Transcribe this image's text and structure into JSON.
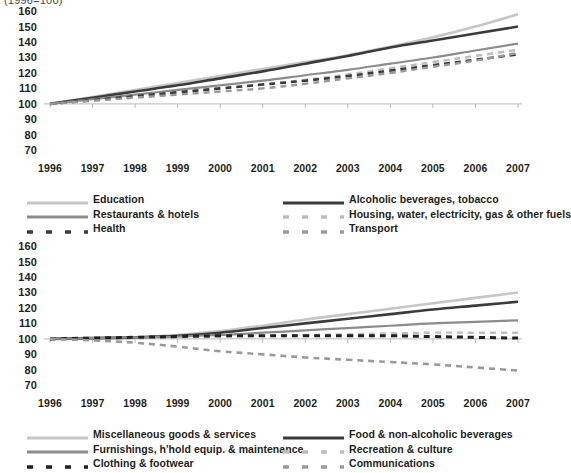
{
  "title": "(1996=100)",
  "axis": {
    "y_ticks": [
      160,
      150,
      140,
      130,
      120,
      110,
      100,
      90,
      80,
      70
    ],
    "ylim": [
      65,
      162
    ],
    "x_ticks": [
      "1996",
      "1997",
      "1998",
      "1999",
      "2000",
      "2001",
      "2002",
      "2003",
      "2004",
      "2005",
      "2006",
      "2007"
    ]
  },
  "colors": {
    "light_gray": "#c6c6c6",
    "mid_gray": "#8c8c8c",
    "dark": "#3b3b3b",
    "black": "#231f20",
    "dash_light": "#bdbdbd",
    "dash_mid": "#9a9a9a",
    "axis": "#b8b8b8"
  },
  "chart_data": [
    {
      "type": "line",
      "title": "(1996=100)",
      "xlabel": "",
      "ylabel": "",
      "ylim": [
        65,
        162
      ],
      "grid": false,
      "legend_position": "bottom",
      "x": [
        1996,
        1997,
        1998,
        1999,
        2000,
        2001,
        2002,
        2003,
        2004,
        2005,
        2006,
        2007
      ],
      "series": [
        {
          "name": "Education",
          "style": "solid",
          "color": "#c6c6c6",
          "width": 2.6,
          "values": [
            100,
            104.5,
            109,
            113.5,
            118,
            122.5,
            127,
            131.5,
            137,
            143,
            150,
            158
          ]
        },
        {
          "name": "Alcoholic beverages, tobacco",
          "style": "solid",
          "color": "#3b3b3b",
          "width": 2.6,
          "values": [
            100,
            104,
            108,
            112,
            116.5,
            121,
            126,
            131,
            136.5,
            141,
            145.5,
            150
          ]
        },
        {
          "name": "Restaurants & hotels",
          "style": "solid",
          "color": "#8c8c8c",
          "width": 2.2,
          "values": [
            100,
            103,
            106,
            109,
            112,
            115,
            118.5,
            122,
            126,
            130,
            134.5,
            139
          ]
        },
        {
          "name": "Housing, water, electricity, gas & other fuels",
          "style": "dashed",
          "color": "#bdbdbd",
          "width": 2.6,
          "values": [
            100,
            102.5,
            105,
            107.5,
            110,
            112.5,
            115.5,
            119,
            123,
            127,
            131,
            135
          ]
        },
        {
          "name": "Health",
          "style": "dashed",
          "color": "#3b3b3b",
          "width": 2.6,
          "values": [
            100,
            102.5,
            105,
            107.5,
            110,
            112.5,
            115,
            118,
            121.5,
            125,
            128.5,
            132
          ]
        },
        {
          "name": "Transport",
          "style": "dashed",
          "color": "#9a9a9a",
          "width": 2.4,
          "values": [
            100,
            102,
            104,
            106,
            108,
            110,
            113,
            116.5,
            120,
            124,
            128,
            133
          ]
        }
      ]
    },
    {
      "type": "line",
      "title": "",
      "xlabel": "",
      "ylabel": "",
      "ylim": [
        65,
        162
      ],
      "grid": false,
      "legend_position": "bottom",
      "x": [
        1996,
        1997,
        1998,
        1999,
        2000,
        2001,
        2002,
        2003,
        2004,
        2005,
        2006,
        2007
      ],
      "series": [
        {
          "name": "Miscellaneous goods & services",
          "style": "solid",
          "color": "#c6c6c6",
          "width": 2.6,
          "values": [
            100,
            100.5,
            101,
            102.5,
            105,
            108.5,
            112.5,
            116,
            119.5,
            123,
            126.5,
            130
          ]
        },
        {
          "name": "Food & non-alcoholic beverages",
          "style": "solid",
          "color": "#3b3b3b",
          "width": 2.6,
          "values": [
            100,
            100.5,
            101,
            102,
            104,
            107,
            110,
            113,
            116,
            119,
            121.5,
            124
          ]
        },
        {
          "name": "Furnishings, h'hold equip. & maintenance",
          "style": "solid",
          "color": "#8c8c8c",
          "width": 2.2,
          "values": [
            100,
            100.5,
            101,
            101.5,
            102.5,
            104,
            105.5,
            107,
            108.5,
            110,
            111,
            112
          ]
        },
        {
          "name": "Recreation & culture",
          "style": "dashed",
          "color": "#bdbdbd",
          "width": 2.4,
          "values": [
            100,
            100,
            100.5,
            101,
            101.5,
            102,
            102.5,
            103,
            103.5,
            104,
            104,
            104
          ]
        },
        {
          "name": "Clothing & footwear",
          "style": "dashed",
          "color": "#231f20",
          "width": 3.0,
          "values": [
            100,
            100.5,
            101,
            101.5,
            102,
            102,
            102,
            102,
            102,
            101.5,
            101,
            100.5
          ]
        },
        {
          "name": "Communications",
          "style": "dashed",
          "color": "#9a9a9a",
          "width": 2.6,
          "values": [
            100,
            99,
            97.5,
            95,
            92,
            90,
            88,
            86.5,
            85,
            83.5,
            81.5,
            79.5
          ]
        }
      ]
    }
  ],
  "legends": [
    {
      "left": [
        {
          "label": "Education",
          "style": "solid",
          "color": "#c6c6c6"
        },
        {
          "label": "Restaurants & hotels",
          "style": "solid",
          "color": "#8c8c8c"
        },
        {
          "label": "Health",
          "style": "dashed",
          "color": "#3b3b3b"
        }
      ],
      "right": [
        {
          "label": "Alcoholic beverages, tobacco",
          "style": "solid",
          "color": "#3b3b3b"
        },
        {
          "label": "Housing, water, electricity, gas & other fuels",
          "style": "dashed",
          "color": "#bdbdbd"
        },
        {
          "label": "Transport",
          "style": "dashed",
          "color": "#9a9a9a"
        }
      ]
    },
    {
      "left": [
        {
          "label": "Miscellaneous goods & services",
          "style": "solid",
          "color": "#c6c6c6"
        },
        {
          "label": "Furnishings, h'hold equip. & maintenance",
          "style": "solid",
          "color": "#8c8c8c"
        },
        {
          "label": "Clothing & footwear",
          "style": "dashed",
          "color": "#231f20"
        }
      ],
      "right": [
        {
          "label": "Food & non-alcoholic beverages",
          "style": "solid",
          "color": "#3b3b3b"
        },
        {
          "label": "Recreation & culture",
          "style": "dashed",
          "color": "#bdbdbd"
        },
        {
          "label": "Communications",
          "style": "dashed",
          "color": "#9a9a9a"
        }
      ]
    }
  ]
}
